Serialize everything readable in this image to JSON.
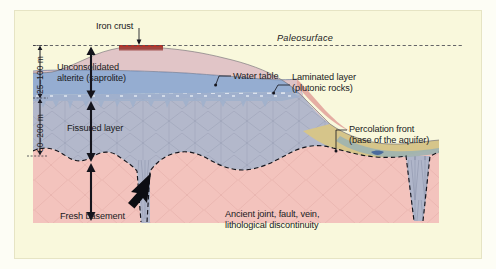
{
  "figure": {
    "type": "geological-cross-section",
    "background_color": "#f9f8dc",
    "outer_color": "#fdfdf5"
  },
  "labels": {
    "iron_crust": "Iron crust",
    "paleosurface": "Paleosurface",
    "unconsolidated_line1": "Unconsolidated",
    "unconsolidated_line2": "alterite (saprolite)",
    "water_table": "Water table",
    "laminated_line1": "Laminated layer",
    "laminated_line2": "(plutonic rocks)",
    "fissured_layer": "Fissured layer",
    "percolation_line1": "Percolation front",
    "percolation_line2": "(base of the aquifer)",
    "fresh_basement": "Fresh basement",
    "ancient_line1": "Ancient joint, fault, vein,",
    "ancient_line2": "lithological discontinuity"
  },
  "scale": {
    "upper": "25–100 m",
    "lower": "50–200 m"
  },
  "colors": {
    "iron_crust": "#b5342a",
    "saprolite_upper": "#e4c5c7",
    "saprolite_lower": "#9fb4d6",
    "fissured_layer": "#b3b8cb",
    "fresh_basement": "#f3c3bd",
    "percolation_front": "#d6c58a",
    "water_body": "#7d9bc8",
    "paleosurface_line": "#4a4a52",
    "label_text": "#1a1a22"
  }
}
